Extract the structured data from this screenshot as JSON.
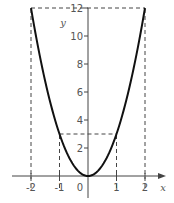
{
  "chart_data": {
    "type": "line",
    "title": "",
    "function": "y = 3x^2",
    "xlabel": "x",
    "ylabel": "y",
    "xlim": [
      -2.6,
      2.7
    ],
    "ylim": [
      -1.6,
      12.2
    ],
    "grid": false,
    "legend": null,
    "x_ticks": [
      -2,
      -1,
      0,
      1,
      2
    ],
    "x_tick_labels": [
      "-2",
      "-1",
      "0",
      "1",
      "2"
    ],
    "y_ticks": [
      2,
      4,
      6,
      8,
      10,
      12
    ],
    "y_tick_labels": [
      "2",
      "4",
      "6",
      "8",
      "10",
      "12"
    ],
    "series": [
      {
        "name": "parabola",
        "x": [
          -2,
          -1.5,
          -1,
          -0.5,
          0,
          0.5,
          1,
          1.5,
          2
        ],
        "y": [
          12,
          6.75,
          3,
          0.75,
          0,
          0.75,
          3,
          6.75,
          12
        ]
      }
    ],
    "annotations": [
      {
        "type": "dashed-line",
        "description": "vertical at x=-2 from axis to y=12"
      },
      {
        "type": "dashed-line",
        "description": "vertical at x=2 from axis to y=12"
      },
      {
        "type": "dashed-line",
        "description": "horizontal at y=12 from x=-2 to x=2"
      },
      {
        "type": "dashed-line",
        "description": "vertical at x=-1 from axis to y=3"
      },
      {
        "type": "dashed-line",
        "description": "vertical at x=1 from axis to y=3"
      },
      {
        "type": "dashed-line",
        "description": "horizontal at y=3 from x=-1 to x=1"
      }
    ],
    "colors": {
      "curve": "#111111",
      "axes": "#444444",
      "dashed": "#444444",
      "labels": "#555555"
    }
  }
}
